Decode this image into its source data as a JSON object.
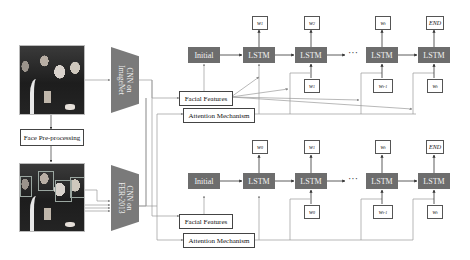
{
  "diagram": {
    "inputs": {
      "top_image": {
        "label": "",
        "description": "group photo (raw)"
      },
      "preprocess": {
        "label": "Face Pre-processing"
      },
      "bottom_image": {
        "label": "",
        "description": "group photo with detected face boxes"
      }
    },
    "cnn": {
      "top": {
        "line1": "CNN on",
        "line2": "ImageNet"
      },
      "bottom": {
        "line1": "CNN on",
        "line2": "FER-2013"
      }
    },
    "branches": [
      {
        "id": "top",
        "initial_label": "Initial",
        "lstm_label": "LSTM",
        "facial_features_label": "Facial Features",
        "attention_label": "Attention Mechanism",
        "outputs": [
          {
            "base": "w",
            "sub": "1"
          },
          {
            "base": "w",
            "sub": "2"
          },
          {
            "base": "w",
            "sub": "t"
          },
          {
            "base": "END",
            "sub": ""
          }
        ],
        "inputs": [
          {
            "base": "w",
            "sub": "1"
          },
          {
            "base": "w",
            "sub": "t-1"
          },
          {
            "base": "w",
            "sub": "t"
          }
        ],
        "ellipsis": "···"
      },
      {
        "id": "bottom",
        "initial_label": "Initial",
        "lstm_label": "LSTM",
        "facial_features_label": "Facial Features",
        "attention_label": "Attention Mechanism",
        "outputs": [
          {
            "base": "w",
            "sub": "0"
          },
          {
            "base": "w",
            "sub": "1"
          },
          {
            "base": "w",
            "sub": "t"
          },
          {
            "base": "END",
            "sub": ""
          }
        ],
        "inputs": [
          {
            "base": "w",
            "sub": "0"
          },
          {
            "base": "w",
            "sub": "t-1"
          },
          {
            "base": "w",
            "sub": "t"
          }
        ],
        "ellipsis": "···"
      }
    ],
    "colors": {
      "block": "#6d6d6d",
      "cnn": "#7a7a7a",
      "line": "#8a8a8a"
    }
  }
}
